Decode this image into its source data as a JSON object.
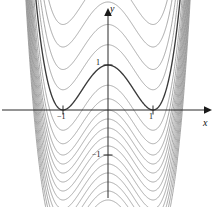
{
  "figure": {
    "name": "quartic-family-graph",
    "background": "#ffffff",
    "width": 217,
    "height": 207
  },
  "axes": {
    "x_label": "x",
    "y_label": "y",
    "x_axis_pixel_y": 110,
    "y_axis_pixel_x": 108,
    "unit_pixels": 45,
    "arrow_color": "#1a1a1a",
    "axis_color": "#2b2b2b"
  },
  "ticks": {
    "x": [
      {
        "label": "−1",
        "value": -1
      },
      {
        "label": "1",
        "value": 1
      }
    ],
    "y": [
      {
        "label": "1",
        "value": 1
      },
      {
        "label": "−1",
        "value": -1
      }
    ]
  },
  "chart_data": {
    "type": "line",
    "title": "",
    "subtitle": "",
    "xlabel": "x",
    "ylabel": "y",
    "xlim": [
      -2.4,
      2.2
    ],
    "ylim": [
      -2.1,
      2.1
    ],
    "grid": false,
    "legend": "none",
    "annotations": [],
    "family_formula": "y = x^4 - 2x^2 + C",
    "highlighted_constant": 1,
    "highlight_color": "#3a3a3a",
    "curve_color": "#8a8a8a",
    "constants": [
      -2.0,
      -1.8,
      -1.6,
      -1.4,
      -1.2,
      -1.0,
      -0.8,
      -0.6,
      -0.4,
      -0.2,
      0.0,
      0.25,
      0.55,
      1.0,
      1.45,
      1.9,
      2.4,
      2.9
    ],
    "series": [
      {
        "name": "C = -2.0",
        "C": -2.0
      },
      {
        "name": "C = -1.8",
        "C": -1.8
      },
      {
        "name": "C = -1.6",
        "C": -1.6
      },
      {
        "name": "C = -1.4",
        "C": -1.4
      },
      {
        "name": "C = -1.2",
        "C": -1.2
      },
      {
        "name": "C = -1.0",
        "C": -1.0
      },
      {
        "name": "C = -0.8",
        "C": -0.8
      },
      {
        "name": "C = -0.6",
        "C": -0.6
      },
      {
        "name": "C = -0.4",
        "C": -0.4
      },
      {
        "name": "C = -0.2",
        "C": -0.2
      },
      {
        "name": "C = 0.0",
        "C": 0.0
      },
      {
        "name": "C = 0.25",
        "C": 0.25
      },
      {
        "name": "C = 0.55",
        "C": 0.55
      },
      {
        "name": "C = 1.0",
        "C": 1.0
      },
      {
        "name": "C = 1.45",
        "C": 1.45
      },
      {
        "name": "C = 1.9",
        "C": 1.9
      },
      {
        "name": "C = 2.4",
        "C": 2.4
      },
      {
        "name": "C = 2.9",
        "C": 2.9
      }
    ]
  }
}
